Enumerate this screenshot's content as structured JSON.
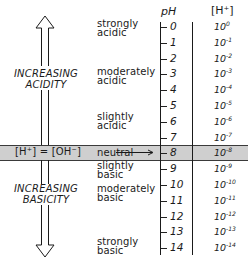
{
  "headers": {
    "ph": "pH",
    "h_conc": "[H⁺]"
  },
  "left_labels": {
    "acidity": [
      "INCREASING",
      "ACIDITY"
    ],
    "basicity": [
      "INCREASING",
      "BASICITY"
    ],
    "neutral_equation": "[H⁺] = [OH⁻]"
  },
  "descriptors": {
    "strongly_acidic": [
      "strongly",
      "acidic"
    ],
    "moderately_acidic": [
      "moderately",
      "acidic"
    ],
    "slightly_acidic": [
      "slightly",
      "acidic"
    ],
    "neutral": "neutral",
    "slightly_basic": [
      "slightly",
      "basic"
    ],
    "moderately_basic": [
      "moderately",
      "basic"
    ],
    "strongly_basic": [
      "strongly",
      "basic"
    ]
  },
  "scale": [
    {
      "ph": "0",
      "base": "10",
      "exp": "0"
    },
    {
      "ph": "1",
      "base": "10",
      "exp": "-1"
    },
    {
      "ph": "2",
      "base": "10",
      "exp": "-2"
    },
    {
      "ph": "3",
      "base": "10",
      "exp": "-3"
    },
    {
      "ph": "4",
      "base": "10",
      "exp": "-4"
    },
    {
      "ph": "5",
      "base": "10",
      "exp": "-5"
    },
    {
      "ph": "6",
      "base": "10",
      "exp": "-6"
    },
    {
      "ph": "7",
      "base": "10",
      "exp": "-7"
    },
    {
      "ph": "8",
      "base": "10",
      "exp": "-8"
    },
    {
      "ph": "9",
      "base": "10",
      "exp": "-9"
    },
    {
      "ph": "10",
      "base": "10",
      "exp": "-10"
    },
    {
      "ph": "11",
      "base": "10",
      "exp": "-11"
    },
    {
      "ph": "12",
      "base": "10",
      "exp": "-12"
    },
    {
      "ph": "13",
      "base": "10",
      "exp": "-13"
    },
    {
      "ph": "14",
      "base": "10",
      "exp": "-14"
    }
  ],
  "colors": {
    "ink": "#1a1a1a",
    "neutral_band": "#cfcfcf"
  }
}
